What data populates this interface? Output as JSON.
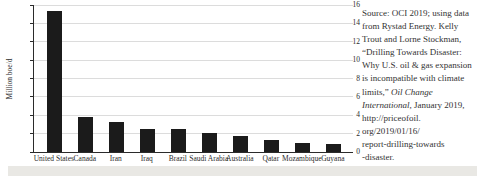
{
  "chart_data": {
    "type": "bar",
    "title": "",
    "xlabel": "",
    "ylabel": "Million boe/d",
    "ylim": [
      0,
      16
    ],
    "ytick_step": 2,
    "grid": true,
    "legend": "none",
    "categories": [
      "United States",
      "Canada",
      "Iran",
      "Iraq",
      "Brazil",
      "Saudi Arabia",
      "Australia",
      "Qatar",
      "Mozambique",
      "Guyana"
    ],
    "values": [
      15.3,
      3.8,
      3.25,
      2.55,
      2.5,
      2.1,
      1.75,
      1.3,
      0.95,
      0.85
    ]
  },
  "source": {
    "lines": [
      {
        "pre": "Source: OCI 2019; using data",
        "italic": "",
        "post": ""
      },
      {
        "pre": "from Rystad Energy. Kelly",
        "italic": "",
        "post": ""
      },
      {
        "pre": "Trout and Lorne Stockman,",
        "italic": "",
        "post": ""
      },
      {
        "pre": "“Drilling Towards Disaster:",
        "italic": "",
        "post": ""
      },
      {
        "pre": "Why U.S. oil & gas expansion",
        "italic": "",
        "post": ""
      },
      {
        "pre": "is incompatible with climate",
        "italic": "",
        "post": ""
      },
      {
        "pre": "limits,” ",
        "italic": "Oil Change",
        "post": ""
      },
      {
        "pre": "",
        "italic": "International",
        "post": ", January 2019,"
      },
      {
        "pre": "http://priceofoil.",
        "italic": "",
        "post": ""
      },
      {
        "pre": "org/2019/01/16/",
        "italic": "",
        "post": ""
      },
      {
        "pre": "report-drilling-towards",
        "italic": "",
        "post": ""
      },
      {
        "pre": "-disaster.",
        "italic": "",
        "post": ""
      }
    ]
  },
  "colors": {
    "bar": "#1b1b1b",
    "grid": "#dcdcdc",
    "axis": "#2b2b2b",
    "text": "#2b2b2b",
    "band": "#e9e8e4"
  }
}
